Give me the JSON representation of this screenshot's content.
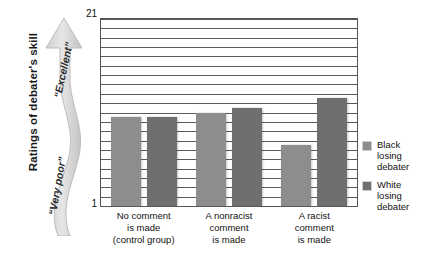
{
  "chart_data": {
    "type": "bar",
    "title": "",
    "xlabel": "",
    "ylabel": "Ratings of debater's skill",
    "ylim": [
      1,
      21
    ],
    "ytick_labels": [
      "1",
      "21"
    ],
    "grid": true,
    "gridline_count": 20,
    "legend_position": "right",
    "categories": [
      "No comment is made (control group)",
      "A nonracist comment is made",
      "A racist comment is made"
    ],
    "category_lines": [
      [
        "No comment",
        "is made",
        "(control group)"
      ],
      [
        "A nonracist",
        "comment",
        "is made"
      ],
      [
        "A racist",
        "comment",
        "is made"
      ]
    ],
    "series": [
      {
        "name": "Black losing debater",
        "color": "#8d8d8d",
        "values": [
          10.5,
          11.0,
          7.5
        ]
      },
      {
        "name": "White losing debater",
        "color": "#6f6f6f",
        "values": [
          10.5,
          11.5,
          12.5
        ]
      }
    ]
  },
  "axis": {
    "y_caption": "Ratings of debater's skill",
    "tick_top": "21",
    "tick_bottom": "1"
  },
  "scale_arrow": {
    "top_label": "“Excellent”",
    "bottom_label": "“Very poor”",
    "color": "#d6d6d6"
  },
  "legend": {
    "items": [
      {
        "label_lines": [
          "Black",
          "losing",
          "debater"
        ],
        "color": "#8d8d8d"
      },
      {
        "label_lines": [
          "White",
          "losing",
          "debater"
        ],
        "color": "#6f6f6f"
      }
    ]
  }
}
